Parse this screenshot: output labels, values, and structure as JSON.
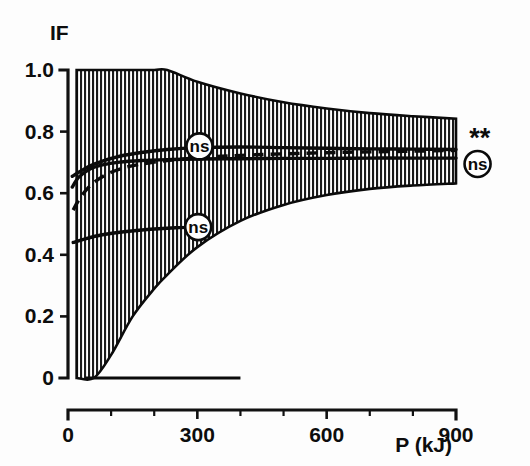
{
  "chart_data": {
    "type": "line",
    "title": "",
    "subtitle": "",
    "ylabel": "IF",
    "xlabel": "P (kJ)",
    "xlim": [
      0,
      900
    ],
    "ylim": [
      0,
      1.0
    ],
    "grid": false,
    "legend_position": "none",
    "x_ticks": [
      0,
      300,
      600,
      900
    ],
    "x_tick_labels": [
      "0",
      "300",
      "600",
      "900"
    ],
    "x_minor_tick_interval": 100,
    "y_ticks": [
      0,
      0.2,
      0.4,
      0.6,
      0.8,
      1.0
    ],
    "y_tick_labels": [
      "0",
      "0.2",
      "0.4",
      "0.6",
      "0.8",
      "1.0"
    ],
    "series": [
      {
        "name": "upper-solid-curve",
        "style": "solid",
        "x": [
          10,
          25,
          50,
          80,
          120,
          170,
          230,
          300,
          400,
          500,
          600,
          700,
          800,
          900
        ],
        "values": [
          0.655,
          0.668,
          0.688,
          0.704,
          0.72,
          0.732,
          0.742,
          0.748,
          0.75,
          0.748,
          0.746,
          0.744,
          0.743,
          0.742
        ]
      },
      {
        "name": "middle-solid-curve",
        "style": "solid",
        "x": [
          10,
          25,
          50,
          80,
          120,
          170,
          230,
          300,
          400,
          500,
          600,
          700,
          800,
          900
        ],
        "values": [
          0.62,
          0.652,
          0.678,
          0.692,
          0.701,
          0.706,
          0.709,
          0.711,
          0.712,
          0.713,
          0.713,
          0.714,
          0.714,
          0.714
        ]
      },
      {
        "name": "dashed-curve",
        "style": "dashed",
        "x": [
          12,
          25,
          45,
          70,
          100,
          140,
          190,
          250,
          320,
          420,
          530,
          650,
          780,
          900
        ],
        "values": [
          0.545,
          0.578,
          0.615,
          0.645,
          0.668,
          0.686,
          0.699,
          0.709,
          0.717,
          0.724,
          0.729,
          0.733,
          0.736,
          0.739
        ]
      },
      {
        "name": "lower-solid-curve",
        "style": "solid",
        "x": [
          12,
          40,
          80,
          130,
          190,
          250,
          310
        ],
        "values": [
          0.44,
          0.452,
          0.465,
          0.475,
          0.483,
          0.488,
          0.49
        ]
      }
    ],
    "bands": [
      {
        "name": "confidence-band",
        "fill": "vertical-hatch",
        "x": [
          20,
          60,
          100,
          150,
          200,
          230,
          300,
          400,
          500,
          600,
          700,
          800,
          900
        ],
        "upper": [
          1.0,
          1.0,
          1.0,
          1.0,
          1.0,
          1.0,
          0.962,
          0.924,
          0.895,
          0.875,
          0.86,
          0.85,
          0.842
        ],
        "lower": [
          0.0,
          0.0,
          0.075,
          0.2,
          0.29,
          0.335,
          0.425,
          0.51,
          0.562,
          0.594,
          0.614,
          0.625,
          0.632
        ]
      }
    ],
    "baseline_segment": {
      "name": "zero-baseline-segment",
      "y": 0.0,
      "x_start": 40,
      "x_end": 400
    },
    "annotations": [
      {
        "name": "ns-upper",
        "label": "ns",
        "shape": "circle",
        "x": 305,
        "y": 0.752
      },
      {
        "name": "ns-lower",
        "label": "ns",
        "shape": "circle",
        "x": 302,
        "y": 0.49
      },
      {
        "name": "stars-right",
        "label": "**",
        "shape": "text",
        "x": 955,
        "y": 0.775
      },
      {
        "name": "ns-right",
        "label": "ns",
        "shape": "circle",
        "x": 950,
        "y": 0.695
      }
    ]
  }
}
